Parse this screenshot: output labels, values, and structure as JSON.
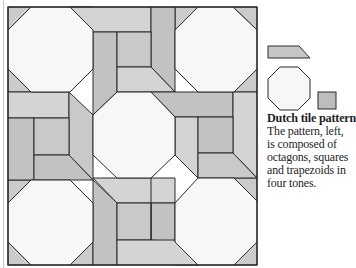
{
  "figure": {
    "title": "Dutch tile pattern",
    "caption_lines": [
      "The pattern, left,",
      "is composed of",
      "octagons, squares",
      "and trapezoids in",
      "four tones."
    ]
  },
  "legend": {
    "shapes": [
      "trapezoid",
      "octagon",
      "square"
    ]
  },
  "tones": {
    "octagon": "#f7f7f7",
    "light": "#d6d6d6",
    "medium": "#c6c6c6",
    "dark": "#b9b9b9",
    "outline": "#2a2a2a"
  }
}
